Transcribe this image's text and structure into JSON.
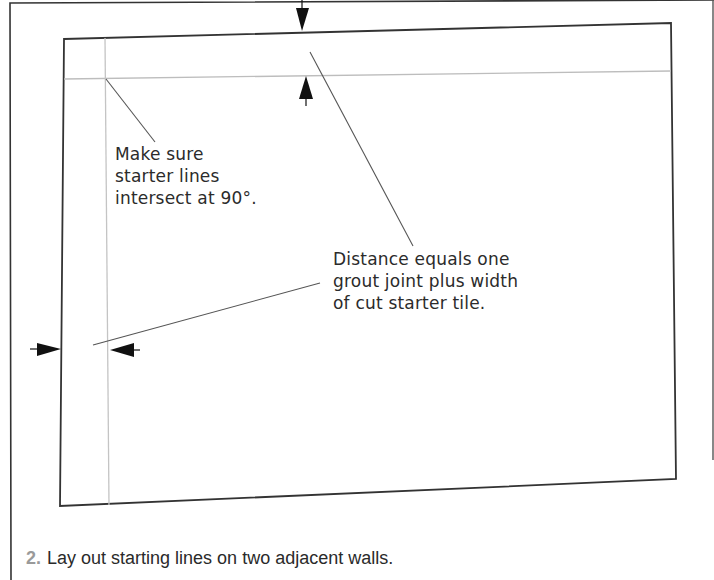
{
  "figure": {
    "annotations": {
      "intersect_note": {
        "lines": [
          "Make sure",
          "starter lines",
          "intersect at 90°."
        ]
      },
      "distance_note": {
        "lines": [
          "Distance equals one",
          "grout joint plus width",
          "of cut starter tile."
        ]
      }
    },
    "caption": {
      "step_number": "2.",
      "text": "Lay out starting lines on two adjacent walls."
    },
    "colors": {
      "wall_outline": "#333333",
      "starter_line": "#bdbdbd",
      "leader_line": "#555555",
      "arrow": "#111111",
      "caption_number": "#9a9a9a"
    },
    "icons": {
      "dimension_arrows": [
        "arrow-down-icon",
        "arrow-up-icon",
        "arrow-right-icon",
        "arrow-left-icon"
      ]
    }
  }
}
